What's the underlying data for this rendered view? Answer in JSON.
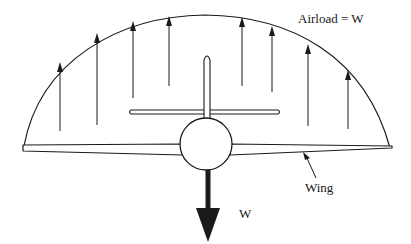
{
  "diagram": {
    "labels": {
      "airload": "Airload = W",
      "wing": "Wing",
      "weight": "W"
    },
    "colors": {
      "stroke": "#1a1a1a",
      "background": "#ffffff"
    },
    "airload_arrows": [
      {
        "x": 60,
        "y_top": 62,
        "y_bottom": 131
      },
      {
        "x": 97,
        "y_top": 33,
        "y_bottom": 125
      },
      {
        "x": 133,
        "y_top": 21,
        "y_bottom": 98
      },
      {
        "x": 169,
        "y_top": 16,
        "y_bottom": 86
      },
      {
        "x": 242,
        "y_top": 17,
        "y_bottom": 86
      },
      {
        "x": 272,
        "y_top": 26,
        "y_bottom": 92
      },
      {
        "x": 308,
        "y_top": 44,
        "y_bottom": 126
      },
      {
        "x": 348,
        "y_top": 70,
        "y_bottom": 129
      }
    ]
  }
}
